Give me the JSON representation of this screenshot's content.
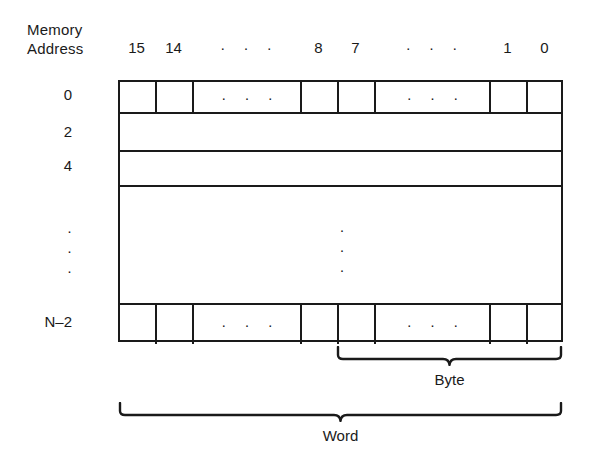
{
  "figure": {
    "address_caption_line1": "Memory",
    "address_caption_line2": "Address"
  },
  "bit_header": {
    "labels": [
      {
        "text": "15",
        "left": 0,
        "width": 37
      },
      {
        "text": "14",
        "left": 37,
        "width": 37
      },
      {
        "text": "· · ·",
        "left": 74,
        "width": 108,
        "is_ellipsis": true
      },
      {
        "text": "8",
        "left": 182,
        "width": 37
      },
      {
        "text": "7",
        "left": 219,
        "width": 37
      },
      {
        "text": "· · ·",
        "left": 256,
        "width": 115,
        "is_ellipsis": true
      },
      {
        "text": "1",
        "left": 371,
        "width": 37
      },
      {
        "text": "0",
        "left": 408,
        "width": 37
      }
    ]
  },
  "address_labels": [
    {
      "text": "0",
      "top": 85
    },
    {
      "text": "2",
      "top": 122
    },
    {
      "text": "4",
      "top": 156
    },
    {
      "text": "N–2",
      "top": 312
    }
  ],
  "address_ellipsis": {
    "dots": [
      "·",
      "·",
      "·"
    ],
    "top": 221
  },
  "memory_table": {
    "rows": [
      {
        "name": "row-address-0",
        "top": 0,
        "height": 32,
        "divided": true,
        "bordered_bottom": true
      },
      {
        "name": "row-address-2",
        "top": 32,
        "height": 38,
        "divided": false,
        "bordered_bottom": true
      },
      {
        "name": "row-address-4",
        "top": 70,
        "height": 35,
        "divided": false,
        "bordered_bottom": true
      },
      {
        "name": "row-gap-region",
        "top": 105,
        "height": 118,
        "divided": false,
        "bordered_bottom": true
      },
      {
        "name": "row-address-n-minus-2",
        "top": 223,
        "height": 39,
        "divided": true,
        "bordered_bottom": false
      }
    ],
    "cells": [
      {
        "name": "bit-15",
        "left": 0,
        "width": 37,
        "content": ""
      },
      {
        "name": "bit-14",
        "left": 37,
        "width": 37,
        "content": ""
      },
      {
        "name": "bits-13-to-9-ellipsis",
        "left": 74,
        "width": 108,
        "content": "· · ·"
      },
      {
        "name": "bit-8",
        "left": 182,
        "width": 37,
        "content": ""
      },
      {
        "name": "bit-7",
        "left": 219,
        "width": 37,
        "content": ""
      },
      {
        "name": "bits-6-to-2-ellipsis",
        "left": 256,
        "width": 115,
        "content": "· · ·"
      },
      {
        "name": "bit-1",
        "left": 371,
        "width": 37,
        "content": ""
      },
      {
        "name": "bit-0",
        "left": 408,
        "width": 37,
        "content": "",
        "last": true
      }
    ],
    "body_ellipsis": {
      "dots": [
        "·",
        "·",
        "·"
      ]
    }
  },
  "braces": {
    "byte": {
      "label": "Byte",
      "left": 336,
      "top": 346,
      "width": 227,
      "height": 20
    },
    "word": {
      "label": "Word",
      "left": 118,
      "top": 402,
      "width": 445,
      "height": 20
    }
  },
  "colors": {
    "ink": "#1a1a1a",
    "background": "#ffffff"
  }
}
